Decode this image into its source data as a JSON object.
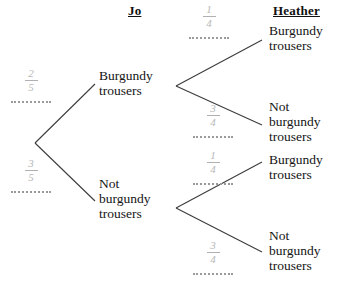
{
  "diagram": {
    "type": "probability-tree",
    "stages": 2,
    "headers": {
      "stage1": "Jo",
      "stage2": "Heather"
    },
    "stage1_nodes": [
      {
        "id": "jo-burgundy",
        "label": "Burgundy\ntrousers",
        "probability": {
          "numerator": "2",
          "denominator": "5"
        }
      },
      {
        "id": "jo-not-burgundy",
        "label": "Not\nburgundy\ntrousers",
        "probability": {
          "numerator": "3",
          "denominator": "5"
        }
      }
    ],
    "stage2_nodes": [
      {
        "id": "h-burgundy-1",
        "parent": "jo-burgundy",
        "label": "Burgundy\ntrousers",
        "probability": {
          "numerator": "1",
          "denominator": "4"
        }
      },
      {
        "id": "h-not-burgundy-1",
        "parent": "jo-burgundy",
        "label": "Not\nburgundy\ntrousers",
        "probability": {
          "numerator": "3",
          "denominator": "4"
        }
      },
      {
        "id": "h-burgundy-2",
        "parent": "jo-not-burgundy",
        "label": "Burgundy\ntrousers",
        "probability": {
          "numerator": "1",
          "denominator": "4"
        }
      },
      {
        "id": "h-not-burgundy-2",
        "parent": "jo-not-burgundy",
        "label": "Not\nburgundy\ntrousers",
        "probability": {
          "numerator": "3",
          "denominator": "4"
        }
      }
    ],
    "colors": {
      "line": "#3c3c3c",
      "text": "#141414",
      "probability": "#b7b7b7",
      "dotted_line": "#9a9a9a",
      "background": "#ffffff"
    }
  }
}
